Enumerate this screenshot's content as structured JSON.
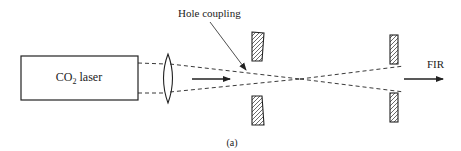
{
  "diagram": {
    "laser_label_main": "CO",
    "laser_label_sub": "2",
    "laser_label_rest": " laser",
    "hole_coupling_label": "Hole coupling",
    "output_label": "FIR",
    "caption": "(a)",
    "colors": {
      "stroke": "#222222",
      "background": "#ffffff"
    }
  }
}
